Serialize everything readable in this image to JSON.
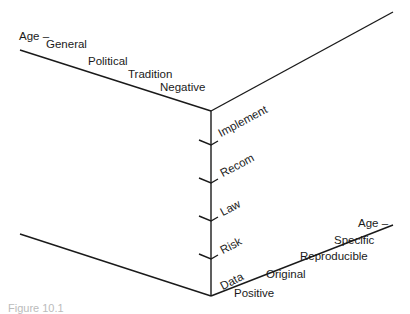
{
  "diagram": {
    "upper_left_axis": [
      "Age –",
      "General",
      "Political",
      "Tradition",
      "Negative"
    ],
    "vertical_axis": [
      "Implement",
      "Recom",
      "Law",
      "Risk",
      "Data"
    ],
    "lower_right_axis": [
      "Positive",
      "Original",
      "Reproducible",
      "Specific",
      "Age –"
    ],
    "caption": "Figure 10.1"
  },
  "colors": {
    "line": "#1a1a1a",
    "background": "#ffffff"
  }
}
